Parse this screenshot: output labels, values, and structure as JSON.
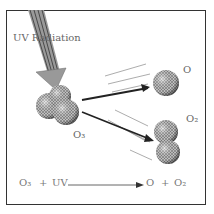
{
  "diagram": {
    "labels": {
      "uv_radiation": "UV Radiation",
      "ozone": "O₃",
      "atom": "O",
      "oxygen_molecule": "O₂"
    },
    "equation": {
      "reactant1": "O₃",
      "plus1": "+",
      "reactant2": "UV",
      "product1": "O",
      "plus2": "+",
      "product2": "O₂"
    },
    "colors": {
      "frame": "#333333",
      "text": "#666666",
      "arrow": "#222222"
    }
  }
}
